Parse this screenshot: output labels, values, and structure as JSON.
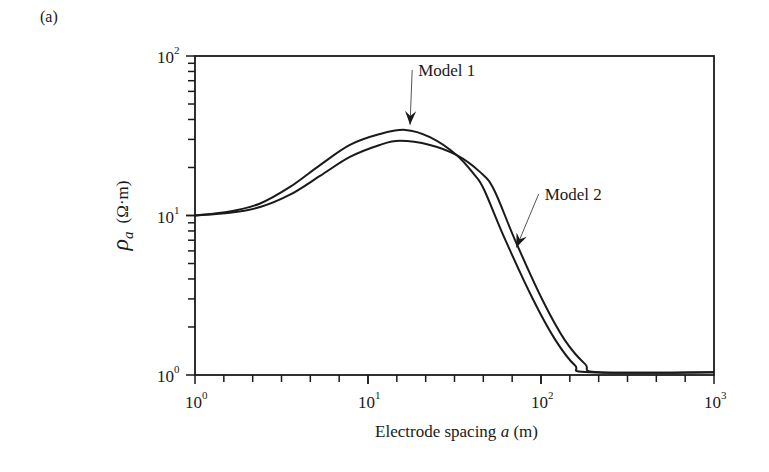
{
  "panel_label": "(a)",
  "chart_data": {
    "type": "line",
    "title": "",
    "xlabel": "Electrode spacing a (m)",
    "xlabel_parts": {
      "prefix": "Electrode spacing ",
      "var": "a",
      "suffix": " (m)"
    },
    "ylabel": "ρa (Ω·m)",
    "ylabel_parts": {
      "symbol": "ρ",
      "sub": "a",
      "unit": "(Ω·m)"
    },
    "xscale": "log",
    "yscale": "log",
    "xlim": [
      1,
      1000
    ],
    "ylim": [
      1,
      100
    ],
    "grid": false,
    "legend": "none (arrow annotations)",
    "x_ticks": [
      {
        "value": 1,
        "base": "10",
        "exp": "0"
      },
      {
        "value": 10,
        "base": "10",
        "exp": "1"
      },
      {
        "value": 100,
        "base": "10",
        "exp": "2"
      },
      {
        "value": 1000,
        "base": "10",
        "exp": "3"
      }
    ],
    "y_ticks": [
      {
        "value": 1,
        "base": "10",
        "exp": "0"
      },
      {
        "value": 10,
        "base": "10",
        "exp": "1"
      },
      {
        "value": 100,
        "base": "10",
        "exp": "2"
      }
    ],
    "series": [
      {
        "name": "Model 1",
        "x": [
          1,
          1.59,
          2.38,
          3.54,
          5.28,
          7.86,
          11.7,
          16.4,
          22.8,
          32.6,
          41.4,
          46.9,
          62.2,
          90.3,
          121,
          157,
          192,
          1000
        ],
        "y": [
          10,
          10.6,
          11.9,
          15.1,
          20.7,
          27.7,
          32.4,
          34.4,
          31.0,
          23.9,
          17.9,
          14.5,
          7.03,
          2.95,
          1.66,
          1.15,
          1.04,
          1.04
        ]
      },
      {
        "name": "Model 2",
        "x": [
          1,
          1.59,
          2.38,
          3.54,
          5.28,
          7.86,
          11.7,
          15.3,
          22.8,
          32.6,
          44.5,
          53.5,
          70.7,
          102,
          137,
          180,
          219,
          1000
        ],
        "y": [
          10,
          10.4,
          11.3,
          13.5,
          17.7,
          23.3,
          27.7,
          29.4,
          27.7,
          23.9,
          18.7,
          14.5,
          7.03,
          2.95,
          1.66,
          1.17,
          1.04,
          1.04
        ]
      }
    ],
    "annotations": [
      {
        "text": "Model 1",
        "text_x": 19.5,
        "text_y": 75,
        "arrow_to_x": 17.5,
        "arrow_to_y": 37
      },
      {
        "text": "Model 2",
        "text_x": 105,
        "text_y": 12.5,
        "arrow_to_x": 72,
        "arrow_to_y": 6.3
      }
    ]
  }
}
